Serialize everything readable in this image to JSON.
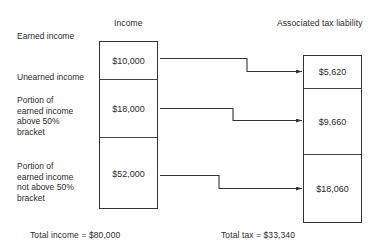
{
  "diagram": {
    "left_header": "Income",
    "right_header": "Associated tax liability",
    "row_labels": [
      "Earned income",
      "Unearned income",
      "Portion of\nearned income\nabove 50%\nbracket",
      "Portion of\nearned income\nnot above 50%\nbracket"
    ],
    "income_segments": [
      {
        "value": "$10,000"
      },
      {
        "value": "$18,000"
      },
      {
        "value": "$52,000"
      }
    ],
    "tax_segments": [
      {
        "value": "$5,620"
      },
      {
        "value": "$9,660"
      },
      {
        "value": "$18,060"
      }
    ],
    "total_income": "Total  income  =  $80,000",
    "total_tax": "Total  tax  =  $33,340",
    "line_color": "#333333"
  }
}
